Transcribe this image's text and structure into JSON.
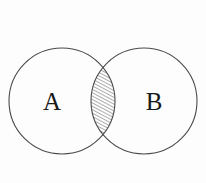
{
  "diagram": {
    "kind": "venn-diagram",
    "title": "",
    "background_color": "#fdfdfd",
    "stroke_color": "#4a4a4a",
    "hatch_color": "#3a3a3a",
    "label_color": "#1a1a1a",
    "sets": [
      {
        "id": "set-a",
        "label": "A",
        "center_x": 62,
        "center_y": 101,
        "radius": 53,
        "label_x": 52,
        "label_y": 104
      },
      {
        "id": "set-b",
        "label": "B",
        "center_x": 144,
        "center_y": 101,
        "radius": 53,
        "label_x": 154,
        "label_y": 104
      }
    ],
    "intersection": {
      "id": "a-intersect-b",
      "label": "",
      "shaded": true,
      "fill_pattern": "diagonal-hatch",
      "hatch_angle_degrees": 62,
      "hatch_spacing_px": 3,
      "top_point_x": 103,
      "top_point_y": 56,
      "bottom_point_x": 103,
      "bottom_point_y": 146,
      "widest_left_x": 85,
      "widest_right_x": 121
    }
  }
}
